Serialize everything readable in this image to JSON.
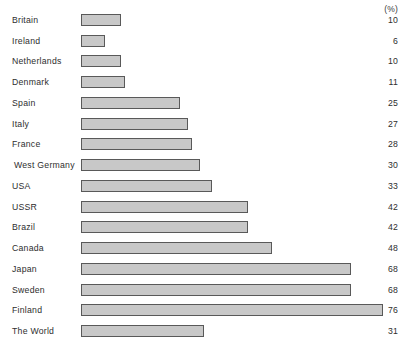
{
  "chart_data": {
    "type": "bar",
    "orientation": "horizontal",
    "title": "",
    "subtitle": "",
    "xlabel": "",
    "ylabel": "",
    "unit_header": "(%)",
    "grid": false,
    "legend": null,
    "xlim": [
      0,
      76
    ],
    "categories": [
      "Britain",
      "Ireland",
      "Netherlands",
      "Denmark",
      "Spain",
      "Italy",
      "France",
      "West Germany",
      "USA",
      "USSR",
      "Brazil",
      "Canada",
      "Japan",
      "Sweden",
      "Finland",
      "The World"
    ],
    "values": [
      10,
      6,
      10,
      11,
      25,
      27,
      28,
      30,
      33,
      42,
      42,
      48,
      68,
      68,
      76,
      31
    ],
    "value_labels": [
      "10",
      "6",
      "10",
      "11",
      "25",
      "27",
      "28",
      "30",
      "33",
      "42",
      "42",
      "48",
      "68",
      "68",
      "76",
      "31"
    ],
    "colors": {
      "bar_fill": "#c8c8c8",
      "bar_border": "#595959",
      "text": "#2e2e2e",
      "background": "#ffffff"
    }
  }
}
